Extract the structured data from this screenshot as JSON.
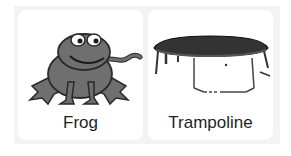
{
  "sprites": [
    {
      "name": "Frog",
      "icon": "frog-icon"
    },
    {
      "name": "Trampoline",
      "icon": "trampoline-icon"
    }
  ],
  "colors": {
    "background": "#f3f3f3",
    "card": "#ffffff",
    "frog_fill": "#6f6f6f",
    "outline": "#2a2a2a",
    "label": "#1f1f1f"
  }
}
